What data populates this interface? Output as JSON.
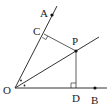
{
  "diagram": {
    "type": "geometry-angle-bisector",
    "colors": {
      "line": "#333333",
      "point": "#111111",
      "background": "#ffffff"
    },
    "points": {
      "O": {
        "label": "O",
        "x": 15,
        "y": 88
      },
      "A": {
        "label": "A",
        "x": 52,
        "y": 15
      },
      "B": {
        "label": "B",
        "x": 95,
        "y": 88
      },
      "P": {
        "label": "P",
        "x": 76,
        "y": 51
      },
      "C": {
        "label": "C",
        "x": 44,
        "y": 33
      },
      "D": {
        "label": "D",
        "x": 76,
        "y": 88
      }
    },
    "labels": {
      "O": "O",
      "A": "A",
      "B": "B",
      "P": "P",
      "C": "C",
      "D": "D"
    },
    "marks": {
      "right_angle_C": "right-angle",
      "right_angle_D": "right-angle",
      "equal_angles_at_O": "dot-marks"
    }
  }
}
